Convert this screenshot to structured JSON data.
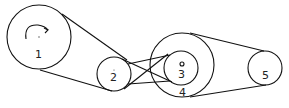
{
  "diagram": {
    "type": "belt-and-pulley",
    "stroke_color": "#111111",
    "background": "#ffffff",
    "pulleys": [
      {
        "id": "1",
        "label": "1",
        "cx": 39,
        "cy": 37,
        "r": 32,
        "note": "driver pulley with clockwise rotation arrow"
      },
      {
        "id": "2",
        "label": "2",
        "cx": 114,
        "cy": 74,
        "r": 17
      },
      {
        "id": "3",
        "label": "3",
        "cx": 181,
        "cy": 68,
        "r": 17,
        "note": "inner pulley on shared shaft with 4"
      },
      {
        "id": "4",
        "label": "4",
        "cx": 182,
        "cy": 65,
        "r": 32
      },
      {
        "id": "5",
        "label": "5",
        "cx": 265,
        "cy": 68,
        "r": 17
      }
    ],
    "belts": [
      {
        "from": "1",
        "to": "2",
        "type": "open"
      },
      {
        "from": "2",
        "to": "3",
        "type": "crossed"
      },
      {
        "from": "4",
        "to": "5",
        "type": "open"
      }
    ],
    "rotation_indicator": {
      "pulley": "1",
      "direction": "clockwise"
    }
  }
}
